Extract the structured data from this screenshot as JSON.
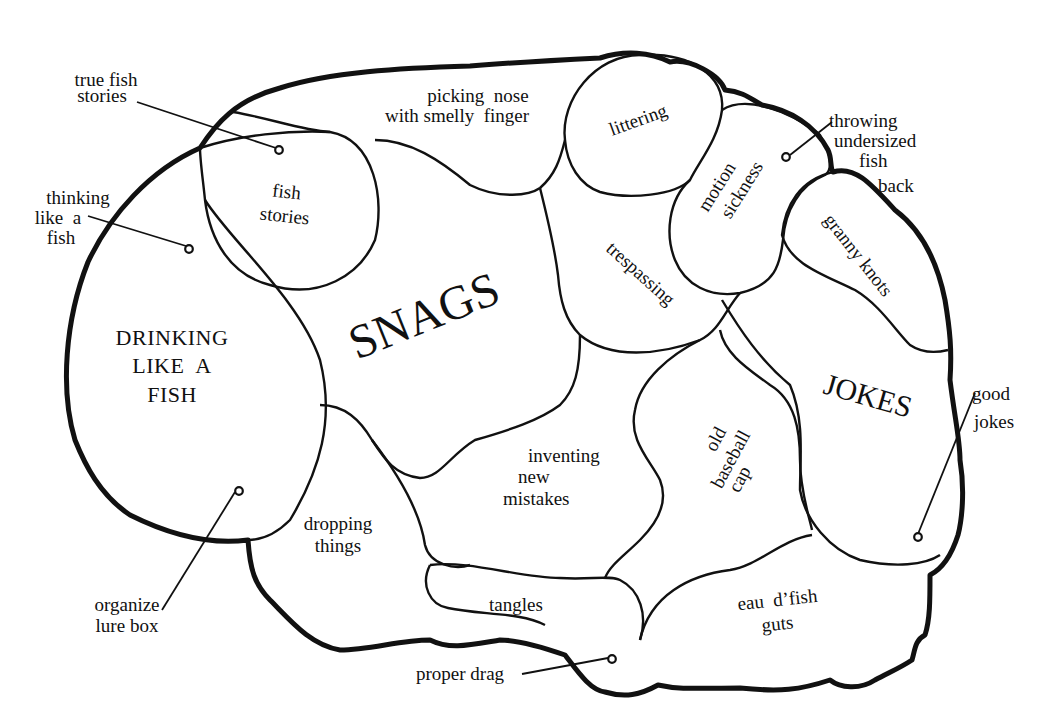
{
  "diagram": {
    "title": "",
    "type": "brain-map",
    "colors": {
      "ink": "#111111",
      "background": "#ffffff"
    },
    "regions": [
      {
        "id": "snags",
        "label": "SNAGS"
      },
      {
        "id": "drinking",
        "lines": [
          "DRINKING",
          "LIKE  A",
          "FISH"
        ]
      },
      {
        "id": "jokes",
        "label": "JOKES"
      },
      {
        "id": "fish-stories",
        "lines": [
          "fish",
          "stories"
        ]
      },
      {
        "id": "picking-nose",
        "lines": [
          "picking  nose",
          "with smelly  finger"
        ]
      },
      {
        "id": "littering",
        "label": "littering"
      },
      {
        "id": "motion-sickness",
        "lines": [
          "motion",
          "sickness"
        ]
      },
      {
        "id": "trespassing",
        "label": "trespassing"
      },
      {
        "id": "granny-knots",
        "label": "granny knots"
      },
      {
        "id": "inventing",
        "lines": [
          "inventing",
          "new",
          "mistakes"
        ]
      },
      {
        "id": "old-cap",
        "lines": [
          "old",
          "baseball",
          "cap"
        ]
      },
      {
        "id": "dropping",
        "lines": [
          "dropping",
          "things"
        ]
      },
      {
        "id": "tangles",
        "label": "tangles"
      },
      {
        "id": "eau",
        "lines": [
          "eau  d’fish",
          "guts"
        ]
      }
    ],
    "callouts": [
      {
        "id": "true-fish-stories",
        "lines": [
          "true fish",
          "stories"
        ]
      },
      {
        "id": "thinking-like-fish",
        "lines": [
          "thinking",
          "like  a",
          "fish"
        ]
      },
      {
        "id": "throwing-back",
        "lines": [
          "throwing",
          "undersized",
          "fish",
          "back"
        ]
      },
      {
        "id": "good-jokes",
        "lines": [
          "good",
          "jokes"
        ]
      },
      {
        "id": "organize-lure-box",
        "lines": [
          "organize",
          "lure box"
        ]
      },
      {
        "id": "proper-drag",
        "label": "proper drag"
      }
    ]
  }
}
